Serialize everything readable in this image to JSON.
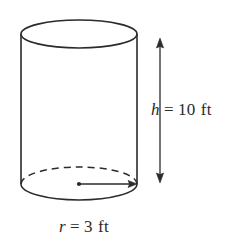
{
  "figure": {
    "name": "labeled-cylinder-diagram",
    "background_color": "#ffffff",
    "stroke_color": "#2b2b2b",
    "shape": "cylinder",
    "labels": {
      "height": {
        "variable": "h",
        "equals": "=",
        "value": "10",
        "unit": "ft",
        "full_text": "h = 10 ft"
      },
      "radius": {
        "variable": "r",
        "equals": "=",
        "value": "3",
        "unit": "ft",
        "full_text": "r = 3 ft"
      }
    },
    "annotations": {
      "height_dimension_arrow": "double-headed-vertical-arrow",
      "radius_dimension_arrow": "single-headed-horizontal-arrow",
      "hidden_edge_style": "dashed",
      "center_marker": "dot"
    }
  }
}
